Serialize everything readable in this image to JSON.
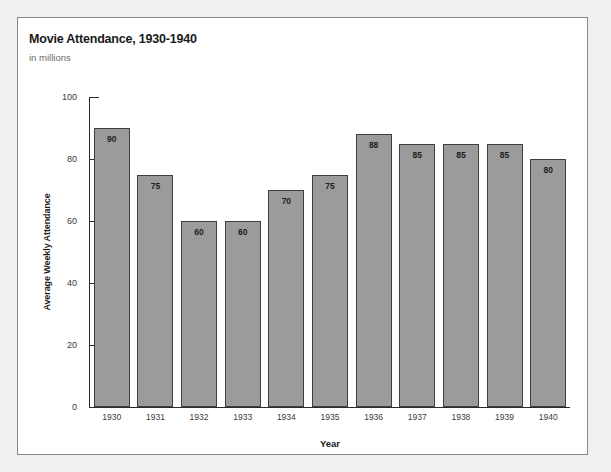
{
  "chart_data": {
    "type": "bar",
    "title": "Movie Attendance, 1930-1940",
    "subtitle": "in millions",
    "xlabel": "Year",
    "ylabel": "Average Weekly Attendance",
    "categories": [
      "1930",
      "1931",
      "1932",
      "1933",
      "1934",
      "1935",
      "1936",
      "1937",
      "1938",
      "1939",
      "1940"
    ],
    "values": [
      90,
      75,
      60,
      60,
      70,
      75,
      88,
      85,
      85,
      85,
      80
    ],
    "data_labels": [
      "90",
      "75",
      "60",
      "60",
      "70",
      "75",
      "88",
      "85",
      "85",
      "85",
      "80"
    ],
    "ylim": [
      0,
      100
    ],
    "yticks": [
      0,
      20,
      40,
      60,
      80,
      100
    ],
    "ytick_labels": [
      "0",
      "20",
      "40",
      "60",
      "80",
      "100"
    ],
    "grid": false,
    "legend": null,
    "bar_color": "#9b9b9b",
    "bar_border_color": "#3f3f3f",
    "axis_color": "#2b2b2b",
    "panel_background": "#ffffff",
    "page_background": "#f0f0f0"
  }
}
